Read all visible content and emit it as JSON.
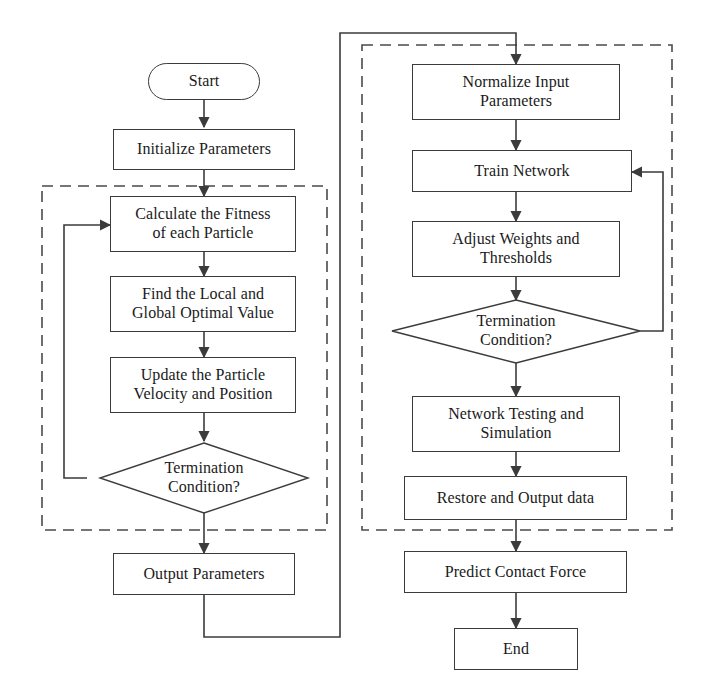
{
  "diagram": {
    "type": "flowchart",
    "colors": {
      "stroke": "#3b3b3b",
      "text": "#1a1a1a",
      "dashed_group": "#4a4a4a",
      "background": "#ffffff"
    },
    "groups": [
      {
        "id": "pso-group",
        "name": "pso-optimization-group",
        "style": "dashed"
      },
      {
        "id": "bp-group",
        "name": "bp-network-group",
        "style": "dashed"
      }
    ],
    "nodes": {
      "start": {
        "label": "Start",
        "shape": "oval"
      },
      "initialize_parameters": {
        "label": "Initialize Parameters",
        "shape": "rectangle"
      },
      "calculate_fitness": {
        "label": "Calculate the Fitness\nof each Particle",
        "shape": "rectangle"
      },
      "find_optimal": {
        "label": "Find the Local and\nGlobal Optimal Value",
        "shape": "rectangle"
      },
      "update_particle": {
        "label": "Update the Particle\nVelocity and Position",
        "shape": "rectangle"
      },
      "termination_left": {
        "label": "Termination\nCondition?",
        "shape": "diamond"
      },
      "output_parameters": {
        "label": "Output Parameters",
        "shape": "rectangle"
      },
      "normalize_input": {
        "label": "Normalize Input\nParameters",
        "shape": "rectangle"
      },
      "train_network": {
        "label": "Train Network",
        "shape": "rectangle"
      },
      "adjust_weights": {
        "label": "Adjust Weights and\nThresholds",
        "shape": "rectangle"
      },
      "termination_right": {
        "label": "Termination\nCondition?",
        "shape": "diamond"
      },
      "network_testing": {
        "label": "Network Testing and\nSimulation",
        "shape": "rectangle"
      },
      "restore_output": {
        "label": "Restore and Output data",
        "shape": "rectangle"
      },
      "predict_contact_force": {
        "label": "Predict Contact Force",
        "shape": "rectangle"
      },
      "end": {
        "label": "End",
        "shape": "rectangle"
      }
    },
    "edges": [
      {
        "from": "start",
        "to": "initialize_parameters"
      },
      {
        "from": "initialize_parameters",
        "to": "calculate_fitness"
      },
      {
        "from": "calculate_fitness",
        "to": "find_optimal"
      },
      {
        "from": "find_optimal",
        "to": "update_particle"
      },
      {
        "from": "update_particle",
        "to": "termination_left"
      },
      {
        "from": "termination_left",
        "to": "calculate_fitness",
        "kind": "feedback-left"
      },
      {
        "from": "termination_left",
        "to": "output_parameters"
      },
      {
        "from": "output_parameters",
        "to": "normalize_input",
        "kind": "cross-branch"
      },
      {
        "from": "normalize_input",
        "to": "train_network"
      },
      {
        "from": "train_network",
        "to": "adjust_weights"
      },
      {
        "from": "adjust_weights",
        "to": "termination_right"
      },
      {
        "from": "termination_right",
        "to": "train_network",
        "kind": "feedback-right"
      },
      {
        "from": "termination_right",
        "to": "network_testing"
      },
      {
        "from": "network_testing",
        "to": "restore_output"
      },
      {
        "from": "restore_output",
        "to": "predict_contact_force"
      },
      {
        "from": "predict_contact_force",
        "to": "end"
      }
    ]
  }
}
